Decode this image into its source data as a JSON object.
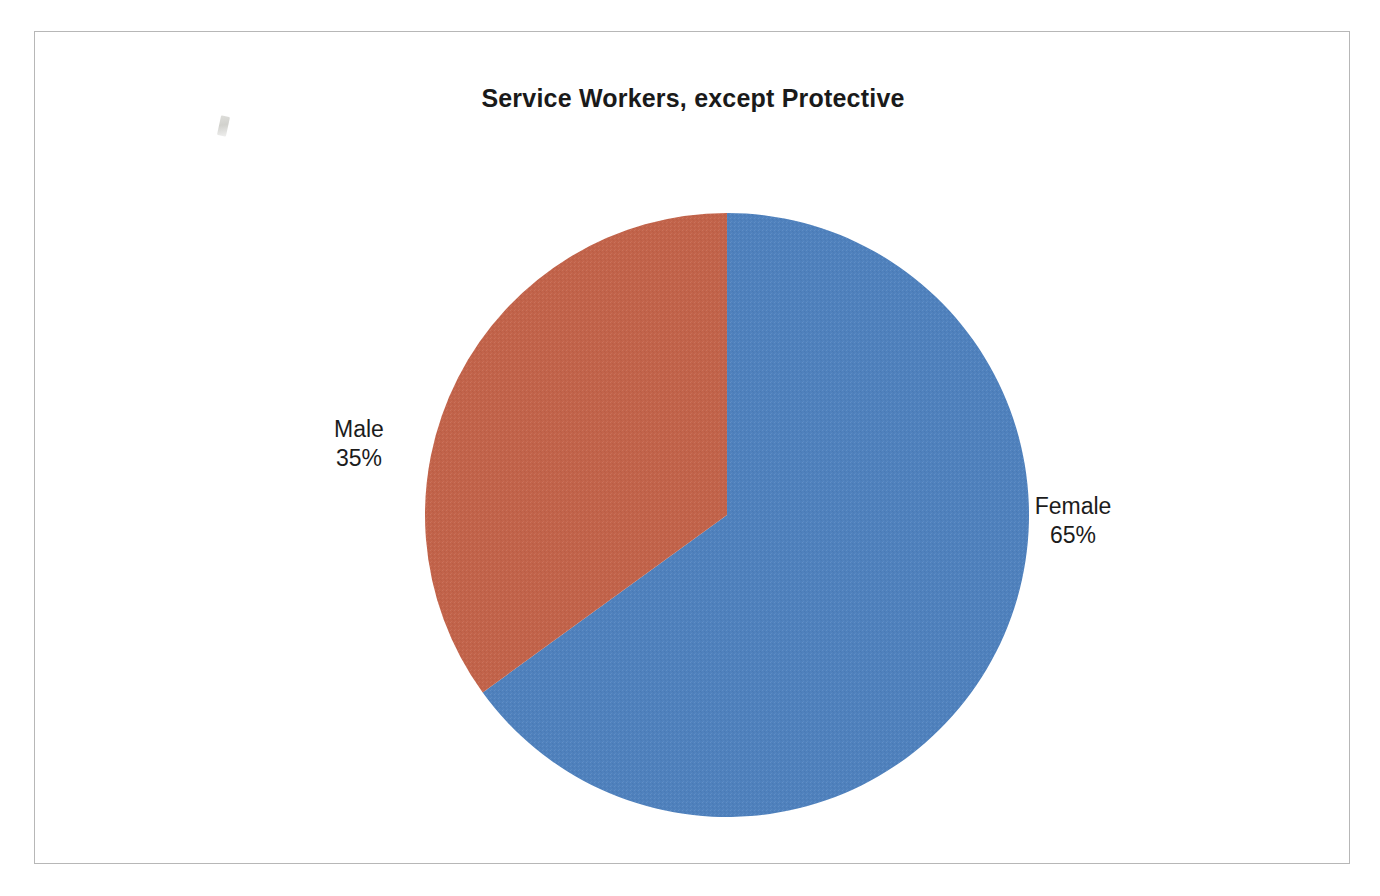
{
  "chart_data": {
    "type": "pie",
    "title": "Service Workers, except Protective",
    "categories": [
      "Female",
      "Male"
    ],
    "values": [
      65,
      35
    ],
    "value_unit": "%",
    "labels": [
      "Female\n65%",
      "Male\n35%"
    ],
    "colors": [
      "#4f81bd",
      "#c2634a"
    ],
    "start_angle_deg": 0,
    "direction": "clockwise",
    "legend": "none",
    "grid": false,
    "slices": [
      {
        "name": "Female",
        "value": 65,
        "value_label": "65%",
        "color": "#4f81bd",
        "start_deg": 0,
        "end_deg": 234
      },
      {
        "name": "Male",
        "value": 35,
        "value_label": "35%",
        "color": "#c2634a",
        "start_deg": 234,
        "end_deg": 360
      }
    ]
  },
  "chart": {
    "title": "Service Workers, except Protective",
    "frame_color": "#b7b7b7",
    "background": "#ffffff"
  },
  "labels": {
    "male": {
      "name": "Male",
      "value": "35%"
    },
    "female": {
      "name": "Female",
      "value": "65%"
    }
  },
  "artifact": {
    "name": "scan-artifact"
  }
}
